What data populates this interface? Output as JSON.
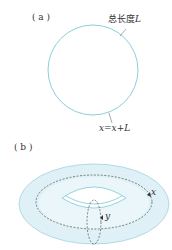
{
  "panel_a": {
    "label": "( a )",
    "length_label": "总长度",
    "length_var": "L",
    "identification": "x=x+L",
    "stroke_color": "#7ec8d8"
  },
  "panel_b": {
    "label": "( b )",
    "x_label": "x",
    "y_label": "y",
    "fill_color": "#dff1f6",
    "stroke_color": "#7ec8d8"
  }
}
